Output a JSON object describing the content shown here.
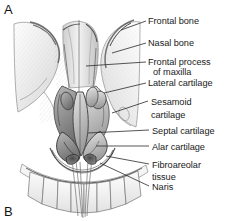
{
  "figure": {
    "panel_markers": [
      {
        "id": "mark-a",
        "text": "A"
      },
      {
        "id": "mark-b",
        "text": "B"
      }
    ],
    "illustration": {
      "name": "anterior-view-external-nose-skeleton",
      "medium": "graphite-pencil-stipple-grayscale",
      "background": "#ffffff",
      "ink": "#2a2a2a"
    },
    "labels": [
      {
        "name": "frontal-bone",
        "text": "Frontal bone",
        "x": 148,
        "y": 16,
        "leader": [
          [
            146,
            21
          ],
          [
            121,
            30
          ]
        ]
      },
      {
        "name": "nasal-bone",
        "text": "Nasal bone",
        "x": 148,
        "y": 38,
        "leader": [
          [
            146,
            43
          ],
          [
            112,
            53
          ]
        ]
      },
      {
        "name": "frontal-process-of-maxilla",
        "text": "Frontal process",
        "x": 148,
        "y": 57,
        "second_line": "of maxilla",
        "second_x": 153,
        "second_y": 67,
        "leader": [
          [
            146,
            62
          ],
          [
            86,
            66
          ]
        ]
      },
      {
        "name": "lateral-cartilage",
        "text": "Lateral cartilage",
        "x": 148,
        "y": 78,
        "leader": [
          [
            146,
            83
          ],
          [
            104,
            93
          ]
        ]
      },
      {
        "name": "sesamoid-cartilage",
        "text": "Sesamoid",
        "x": 151,
        "y": 97,
        "second_line": "cartilage",
        "second_x": 151,
        "second_y": 110,
        "leader": [
          [
            148,
            101
          ],
          [
            112,
            113
          ]
        ]
      },
      {
        "name": "septal-cartilage",
        "text": "Septal cartilage",
        "x": 152,
        "y": 126,
        "leader": [
          [
            149,
            130
          ],
          [
            88,
            133
          ]
        ]
      },
      {
        "name": "alar-cartilage",
        "text": "Alar cartilage",
        "x": 152,
        "y": 142,
        "leader": [
          [
            149,
            146
          ],
          [
            96,
            146
          ]
        ]
      },
      {
        "name": "fibroareolar-tissue",
        "text": "Fibroareolar",
        "x": 152,
        "y": 160,
        "second_line": "tissue",
        "second_x": 152,
        "second_y": 172,
        "leader": [
          [
            149,
            164
          ],
          [
            106,
            156
          ]
        ]
      },
      {
        "name": "naris",
        "text": "Naris",
        "x": 152,
        "y": 182,
        "leader": [
          [
            149,
            186
          ],
          [
            100,
            163
          ]
        ]
      }
    ]
  }
}
